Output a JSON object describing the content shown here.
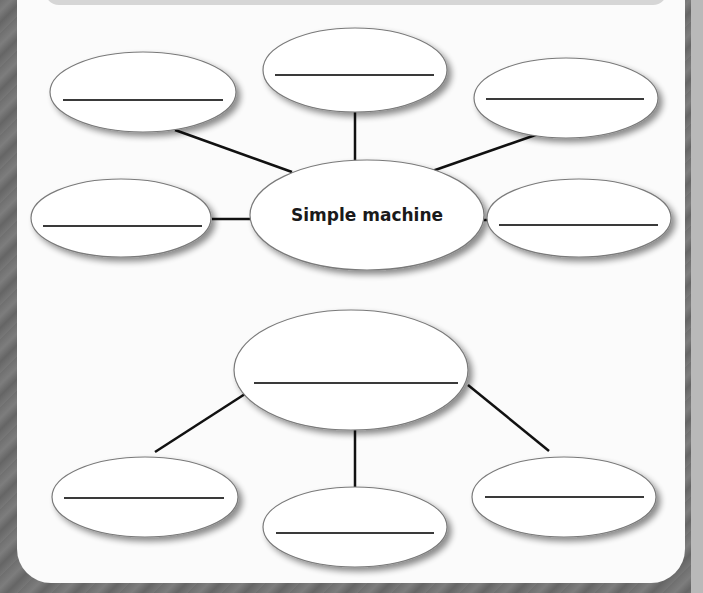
{
  "worksheet": {
    "top_web": {
      "center": {
        "label": "Simple machine"
      },
      "branches": [
        {
          "id": "top-left",
          "answer": ""
        },
        {
          "id": "top-center",
          "answer": ""
        },
        {
          "id": "top-right",
          "answer": ""
        },
        {
          "id": "middle-left",
          "answer": ""
        },
        {
          "id": "middle-right",
          "answer": ""
        }
      ]
    },
    "bottom_web": {
      "center": {
        "label": "",
        "answer": ""
      },
      "branches": [
        {
          "id": "bottom-left",
          "answer": ""
        },
        {
          "id": "bottom-center",
          "answer": ""
        },
        {
          "id": "bottom-right",
          "answer": ""
        }
      ]
    },
    "colors": {
      "page": "#fbfbfb",
      "frame": "#6f6f6f",
      "band": "#d6d6d6",
      "ellipse_stroke": "#7a7a7a",
      "connector": "#111111",
      "answer_line": "#3a3a3a",
      "center_text": "#1a1a1a"
    }
  }
}
